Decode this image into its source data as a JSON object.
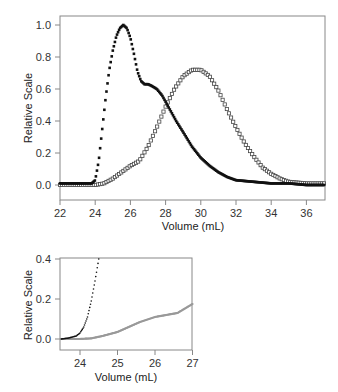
{
  "chart_data": [
    {
      "type": "scatter",
      "panel": "main",
      "title": "",
      "xlabel": "Volume (mL)",
      "ylabel": "Relative Scale",
      "xlim": [
        22,
        37
      ],
      "ylim": [
        -0.08,
        1.05
      ],
      "xticks": [
        "22",
        "24",
        "26",
        "28",
        "30",
        "32",
        "34",
        "36"
      ],
      "yticks": [
        "0.0",
        "0.2",
        "0.4",
        "0.6",
        "0.8",
        "1.0"
      ],
      "grid": false,
      "legend": null,
      "series": [
        {
          "name": "filled-squares",
          "marker": "filled square",
          "color": "#111111",
          "x": [
            22,
            23,
            23.8,
            24.0,
            24.2,
            24.4,
            24.6,
            24.8,
            25.0,
            25.2,
            25.4,
            25.6,
            25.8,
            26.0,
            26.2,
            26.4,
            26.6,
            26.8,
            27.0,
            27.2,
            27.5,
            27.8,
            28.0,
            28.3,
            28.6,
            29.0,
            29.5,
            30.0,
            30.5,
            31.0,
            31.5,
            32.0,
            33.0,
            34.0,
            35.0,
            36.0,
            37.0
          ],
          "y": [
            0.01,
            0.01,
            0.01,
            0.03,
            0.15,
            0.35,
            0.55,
            0.72,
            0.84,
            0.93,
            0.98,
            1.0,
            0.98,
            0.92,
            0.82,
            0.71,
            0.65,
            0.63,
            0.63,
            0.62,
            0.6,
            0.56,
            0.52,
            0.46,
            0.4,
            0.33,
            0.24,
            0.17,
            0.12,
            0.08,
            0.05,
            0.03,
            0.02,
            0.01,
            0.01,
            0.0,
            0.0
          ]
        },
        {
          "name": "open-squares",
          "marker": "open square",
          "color": "#444444",
          "x": [
            22,
            23,
            24,
            24.5,
            25.0,
            25.5,
            26.0,
            26.5,
            27.0,
            27.5,
            28.0,
            28.5,
            29.0,
            29.5,
            30.0,
            30.5,
            31.0,
            31.5,
            32.0,
            32.5,
            33.0,
            33.5,
            34.0,
            34.5,
            35.0,
            36.0,
            37.0
          ],
          "y": [
            0.0,
            0.0,
            0.0,
            0.01,
            0.04,
            0.08,
            0.12,
            0.15,
            0.24,
            0.36,
            0.49,
            0.6,
            0.68,
            0.72,
            0.72,
            0.68,
            0.59,
            0.47,
            0.36,
            0.26,
            0.18,
            0.11,
            0.07,
            0.04,
            0.02,
            0.01,
            0.01
          ]
        }
      ]
    },
    {
      "type": "scatter",
      "panel": "inset",
      "title": "",
      "xlabel": "Volume (mL)",
      "ylabel": "Relative Scale",
      "xlim": [
        23.5,
        27
      ],
      "ylim": [
        -0.05,
        0.4
      ],
      "xticks": [
        "24",
        "25",
        "26",
        "27"
      ],
      "yticks": [
        "0.0",
        "0.2",
        "0.4"
      ],
      "grid": false,
      "legend": null,
      "series": [
        {
          "name": "black-dots",
          "marker": "small dot",
          "color": "#111111",
          "x": [
            23.5,
            23.7,
            23.9,
            24.0,
            24.1,
            24.2,
            24.3,
            24.4,
            24.5
          ],
          "y": [
            0.0,
            0.005,
            0.015,
            0.03,
            0.06,
            0.11,
            0.19,
            0.29,
            0.4
          ]
        },
        {
          "name": "gray-dots",
          "marker": "small dot",
          "color": "#999999",
          "x": [
            23.5,
            24.0,
            24.3,
            24.6,
            25.0,
            25.3,
            25.6,
            26.0,
            26.3,
            26.6,
            27.0
          ],
          "y": [
            0.0,
            0.0,
            0.003,
            0.015,
            0.035,
            0.06,
            0.085,
            0.11,
            0.12,
            0.13,
            0.175
          ]
        }
      ]
    }
  ],
  "main_chart": {
    "ylabel": "Relative Scale",
    "xlabel": "Volume (mL)",
    "yticks": [
      "1.0",
      "0.8",
      "0.6",
      "0.4",
      "0.2",
      "0.0"
    ],
    "xticks": [
      "22",
      "24",
      "26",
      "28",
      "30",
      "32",
      "34",
      "36"
    ]
  },
  "inset_chart": {
    "ylabel": "Relative Scale",
    "xlabel": "Volume (mL)",
    "yticks": [
      "0.4",
      "0.2",
      "0.0"
    ],
    "xticks": [
      "24",
      "25",
      "26",
      "27"
    ]
  }
}
